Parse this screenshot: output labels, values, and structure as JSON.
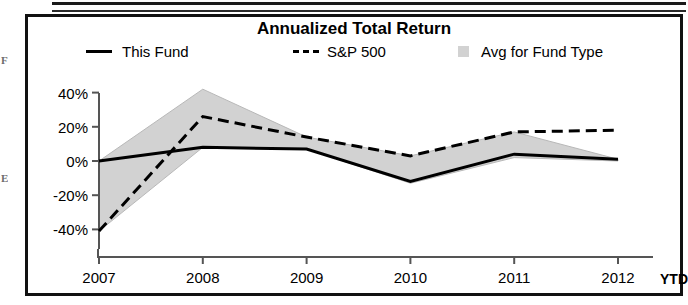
{
  "page": {
    "edge_fragments": [
      "F",
      "E"
    ]
  },
  "chart": {
    "title": "Annualized Total Return",
    "legend": [
      {
        "name": "this-fund",
        "label": "This Fund",
        "marker": "solid-line",
        "color": "#000000"
      },
      {
        "name": "sp-500",
        "label": "S&P 500",
        "marker": "dashed-line",
        "color": "#000000"
      },
      {
        "name": "avg-fund-type",
        "label": "Avg for Fund Type",
        "marker": "filled-swatch",
        "color": "#d2d2d2"
      }
    ],
    "axis_ytd_label": "YTD"
  },
  "chart_data": {
    "type": "line",
    "title": "Annualized Total Return",
    "xlabel": "",
    "ylabel": "",
    "x": [
      "2007",
      "2008",
      "2009",
      "2010",
      "2011",
      "2012"
    ],
    "xtick_labels": [
      "2007",
      "2008",
      "2009",
      "2010",
      "2011",
      "2012"
    ],
    "ytick_labels": [
      "40%",
      "20%",
      "0%",
      "-20%",
      "-40%"
    ],
    "ytick_values": [
      40,
      20,
      0,
      -20,
      -40
    ],
    "ylim": [
      -48,
      48
    ],
    "grid": false,
    "legend_position": "top",
    "series": [
      {
        "name": "This Fund",
        "style": "solid",
        "color": "#000000",
        "values": [
          0,
          8,
          7,
          -12,
          4,
          1
        ]
      },
      {
        "name": "S&P 500",
        "style": "dashed",
        "color": "#000000",
        "values": [
          -41,
          26,
          14,
          3,
          17,
          18
        ]
      },
      {
        "name": "Avg for Fund Type",
        "style": "band",
        "color": "#d2d2d2",
        "band_upper": [
          0,
          42,
          14,
          3,
          17,
          1
        ],
        "band_lower": [
          -41,
          8,
          7,
          -13,
          2,
          0
        ]
      }
    ]
  }
}
